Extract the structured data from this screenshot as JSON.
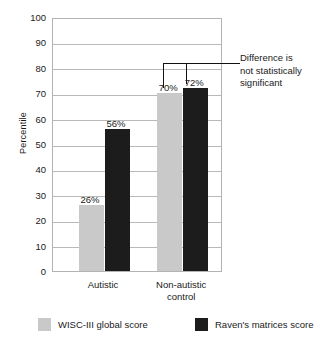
{
  "chart_data": {
    "type": "bar",
    "title": "",
    "xlabel": "",
    "ylabel": "Percentile",
    "ylim": [
      0,
      100
    ],
    "ytick_step": 10,
    "grid": true,
    "legend_position": "bottom",
    "categories": [
      "Autistic",
      "Non-autistic\ncontrol"
    ],
    "category_labels_flat": [
      "Autistic",
      "Non-autistic control"
    ],
    "yticks": [
      "100",
      "90",
      "80",
      "70",
      "60",
      "50",
      "40",
      "30",
      "20",
      "10",
      "0"
    ],
    "series": [
      {
        "name": "WISC-III global score",
        "color": "#c9c9c9",
        "values": [
          26,
          70
        ],
        "value_labels": [
          "26%",
          "70%"
        ]
      },
      {
        "name": "Raven's matrices score",
        "color": "#1c1c1c",
        "values": [
          56,
          72
        ],
        "value_labels": [
          "56%",
          "72%"
        ]
      }
    ],
    "annotations": [
      {
        "text": "Difference is not statistically significant",
        "lines": [
          "Difference is",
          "not statistically",
          "significant"
        ],
        "points_to": [
          "Non-autistic control / WISC-III global score",
          "Non-autistic control / Raven's matrices score"
        ]
      }
    ]
  },
  "axis": {
    "y_title": "Percentile"
  },
  "legend": {
    "items": [
      {
        "label": "WISC-III global score",
        "color": "#c9c9c9"
      },
      {
        "label": "Raven's matrices score",
        "color": "#1c1c1c"
      }
    ]
  },
  "colors": {
    "light_bar": "#c9c9c9",
    "dark_bar": "#1c1c1c",
    "gridline": "#b9b9b9",
    "frame": "#b3b3b3",
    "text": "#1a1a1a"
  }
}
